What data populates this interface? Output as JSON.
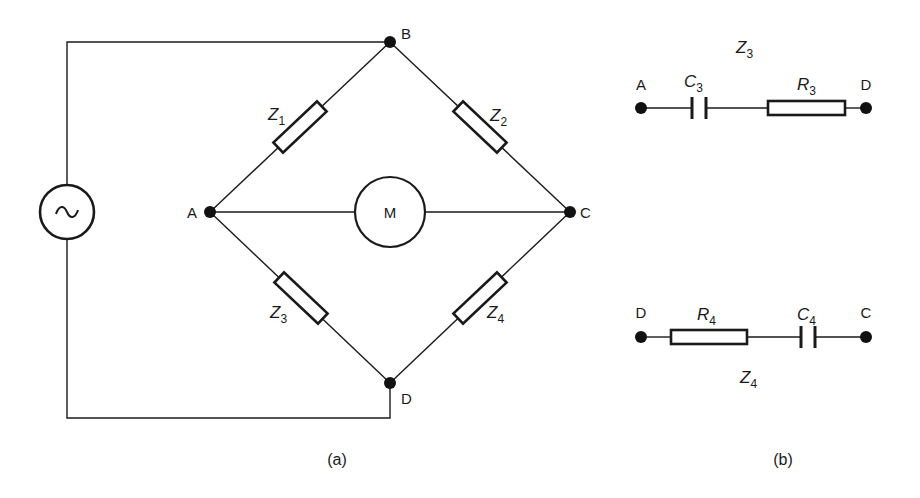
{
  "figure": {
    "panel_a": {
      "caption": "(a)",
      "nodes": {
        "A": "A",
        "B": "B",
        "C": "C",
        "D": "D"
      },
      "impedances": [
        {
          "name": "Z",
          "sub": "1",
          "between": "A-B"
        },
        {
          "name": "Z",
          "sub": "2",
          "between": "B-C"
        },
        {
          "name": "Z",
          "sub": "3",
          "between": "A-D"
        },
        {
          "name": "Z",
          "sub": "4",
          "between": "D-C"
        }
      ],
      "meter_label": "M",
      "source_symbol": "~"
    },
    "panel_b": {
      "caption": "(b)",
      "z3": {
        "title_name": "Z",
        "title_sub": "3",
        "left_node": "A",
        "right_node": "D",
        "cap_name": "C",
        "cap_sub": "3",
        "res_name": "R",
        "res_sub": "3"
      },
      "z4": {
        "title_name": "Z",
        "title_sub": "4",
        "left_node": "D",
        "right_node": "C",
        "res_name": "R",
        "res_sub": "4",
        "cap_name": "C",
        "cap_sub": "4"
      }
    }
  }
}
